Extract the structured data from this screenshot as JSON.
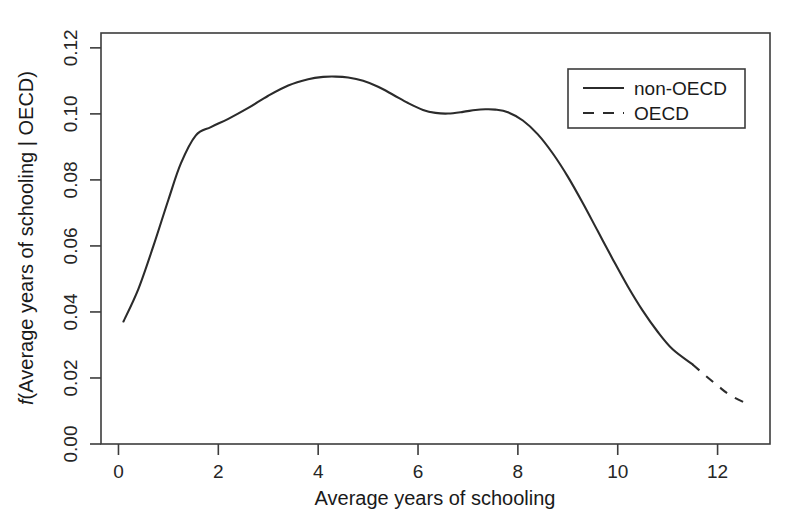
{
  "chart_data": {
    "type": "line",
    "title": "",
    "subtitle": "",
    "xlabel": "Average years of schooling",
    "ylabel": "f(Average years of schooling | OECD)",
    "ylabel_italic_prefix": "f",
    "ylabel_rest": "(Average years of schooling | OECD)",
    "xlim": [
      -0.35,
      13.05
    ],
    "ylim": [
      0.0,
      0.1245
    ],
    "xticks": [
      0,
      2,
      4,
      6,
      8,
      10,
      12
    ],
    "xtick_labels": [
      "0",
      "2",
      "4",
      "6",
      "8",
      "10",
      "12"
    ],
    "yticks": [
      0.0,
      0.02,
      0.04,
      0.06,
      0.08,
      0.1,
      0.12
    ],
    "ytick_labels": [
      "0.00",
      "0.02",
      "0.04",
      "0.06",
      "0.08",
      "0.10",
      "0.12"
    ],
    "grid": false,
    "legend_position": "top-right",
    "legend_entries": [
      {
        "label": "non-OECD",
        "style": "solid"
      },
      {
        "label": "OECD",
        "style": "dashed"
      }
    ],
    "series": [
      {
        "name": "non-OECD",
        "style": "solid",
        "x": [
          0.1,
          0.4,
          0.7,
          1.0,
          1.25,
          1.55,
          1.85,
          2.2,
          2.6,
          3.0,
          3.4,
          3.8,
          4.1,
          4.35,
          4.6,
          4.9,
          5.2,
          5.5,
          5.8,
          6.1,
          6.35,
          6.6,
          6.9,
          7.15,
          7.35,
          7.55,
          7.8,
          8.1,
          8.4,
          8.7,
          9.0,
          9.3,
          9.6,
          9.9,
          10.2,
          10.5,
          10.8,
          11.1,
          11.5
        ],
        "y": [
          0.0371,
          0.047,
          0.06,
          0.074,
          0.085,
          0.0935,
          0.096,
          0.0985,
          0.1018,
          0.1055,
          0.1086,
          0.1105,
          0.1112,
          0.1113,
          0.111,
          0.11,
          0.1082,
          0.1058,
          0.1033,
          0.1012,
          0.1003,
          0.1001,
          0.1006,
          0.1012,
          0.1014,
          0.1013,
          0.1005,
          0.098,
          0.0938,
          0.088,
          0.081,
          0.073,
          0.0645,
          0.056,
          0.0478,
          0.0404,
          0.034,
          0.0287,
          0.0241
        ]
      },
      {
        "name": "OECD",
        "style": "dashed",
        "x": [
          11.5,
          11.75,
          12.0,
          12.25,
          12.6
        ],
        "y": [
          0.0241,
          0.0208,
          0.0177,
          0.0148,
          0.0121
        ]
      }
    ],
    "annotations": [],
    "colors": {
      "line": "#2b2b2b",
      "axis": "#3c3c3c",
      "background": "#ffffff",
      "text": "#1a1a1a"
    }
  },
  "axes": {
    "x_title": "Average years of schooling",
    "y_title_italic": "f",
    "y_title_rest": "(Average years of schooling | OECD)"
  },
  "legend": {
    "items": [
      {
        "label": "non-OECD"
      },
      {
        "label": "OECD"
      }
    ]
  },
  "xtick_labels": [
    "0",
    "2",
    "4",
    "6",
    "8",
    "10",
    "12"
  ],
  "ytick_labels": [
    "0.00",
    "0.02",
    "0.04",
    "0.06",
    "0.08",
    "0.10",
    "0.12"
  ]
}
